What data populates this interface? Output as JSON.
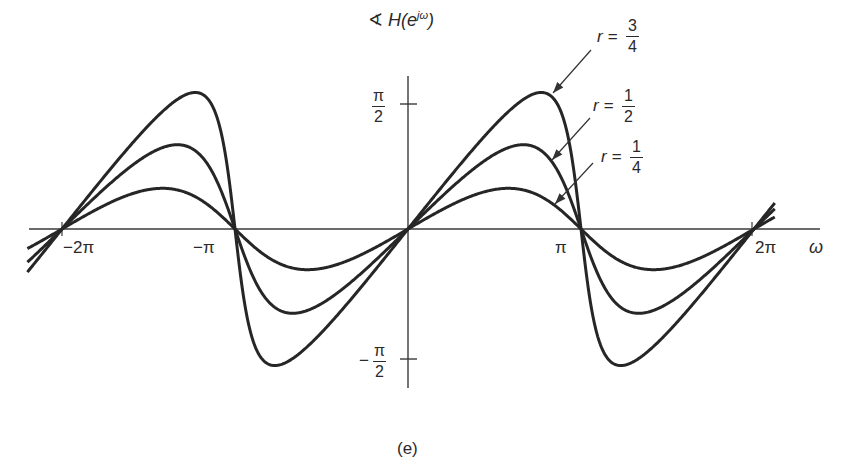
{
  "chart_data": {
    "type": "line",
    "title": "",
    "ylabel": "∢ H(e^{jω})",
    "xlabel": "ω",
    "caption": "(e)",
    "x_ticks": [
      {
        "value": "-2π",
        "label": "−2π"
      },
      {
        "value": "-π",
        "label": "−π"
      },
      {
        "value": "π",
        "label": "π"
      },
      {
        "value": "2π",
        "label": "2π"
      }
    ],
    "y_ticks": [
      {
        "value": "π/2",
        "num": "π",
        "den": "2",
        "sign": ""
      },
      {
        "value": "-π/2",
        "num": "π",
        "den": "2",
        "sign": "−"
      }
    ],
    "xlim": [
      "-2.2π",
      "2.2π"
    ],
    "ylim": [
      "-π/2",
      "π/2"
    ],
    "grid": false,
    "legend_position": "annotations with arrows, upper right",
    "series": [
      {
        "name": "r = 3/4",
        "r": 0.75,
        "peak_omega": "0.77π",
        "peak_value_rad": 0.848
      },
      {
        "name": "r = 1/2",
        "r": 0.5,
        "peak_omega": "0.67π",
        "peak_value_rad": 0.524
      },
      {
        "name": "r = 1/4",
        "r": 0.25,
        "peak_omega": "0.58π",
        "peak_value_rad": 0.253
      }
    ],
    "annotations": [
      {
        "text": "r = 3/4",
        "r_label": "r =",
        "num": "3",
        "den": "4"
      },
      {
        "text": "r = 1/2",
        "r_label": "r =",
        "num": "1",
        "den": "2"
      },
      {
        "text": "r = 1/4",
        "r_label": "r =",
        "num": "1",
        "den": "4"
      }
    ],
    "note": "Periodic phase response, zero crossings at multiples of π, odd symmetry about ω = 0"
  },
  "labels": {
    "angle_symbol": "∢",
    "y_main": "H(e",
    "y_sup": "jω",
    "y_close": ")",
    "omega": "ω",
    "caption": "(e)"
  },
  "colors": {
    "curve": "#262626",
    "axis": "#3a3a3a",
    "text": "#2a2a2a"
  }
}
